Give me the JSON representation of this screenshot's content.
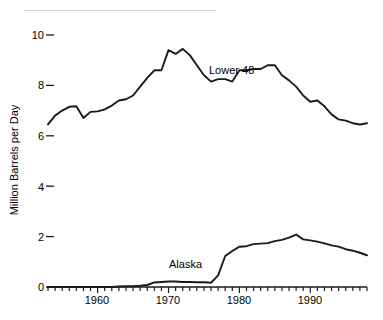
{
  "chart_data": {
    "type": "line",
    "title": "",
    "subtitle": "",
    "xlabel": "",
    "ylabel": "Million Barrels per Day",
    "xlim": [
      1953,
      1998
    ],
    "ylim": [
      0,
      10.6
    ],
    "grid": false,
    "legend_position": "inline-annotation",
    "y_ticks": [
      0,
      2,
      4,
      6,
      8,
      10
    ],
    "y_tick_labels": [
      "0",
      "2",
      "4",
      "6",
      "8",
      "10"
    ],
    "x_ticks": [
      1960,
      1970,
      1980,
      1990
    ],
    "x_tick_labels": [
      "1960",
      "1970",
      "1980",
      "1990"
    ],
    "x_minor_tick_interval": 1,
    "annotations": [
      {
        "text": "Lower 48",
        "x": 1975.5,
        "y": 8.25
      },
      {
        "text": "Alaska",
        "x": 1970.5,
        "y": 1.0
      }
    ],
    "series": [
      {
        "name": "Lower 48",
        "color": "#1a1a1a",
        "x": [
          1953,
          1954,
          1955,
          1956,
          1957,
          1958,
          1959,
          1960,
          1961,
          1962,
          1963,
          1964,
          1965,
          1966,
          1967,
          1968,
          1969,
          1970,
          1971,
          1972,
          1973,
          1974,
          1975,
          1976,
          1977,
          1978,
          1979,
          1980,
          1981,
          1982,
          1983,
          1984,
          1985,
          1986,
          1987,
          1988,
          1989,
          1990,
          1991,
          1992,
          1993,
          1994,
          1995,
          1996,
          1997,
          1998
        ],
        "values": [
          6.45,
          6.8,
          7.0,
          7.15,
          7.17,
          6.71,
          6.95,
          6.97,
          7.05,
          7.2,
          7.4,
          7.45,
          7.6,
          7.95,
          8.3,
          8.6,
          8.6,
          9.4,
          9.25,
          9.45,
          9.2,
          8.8,
          8.4,
          8.15,
          8.25,
          8.25,
          8.15,
          8.6,
          8.6,
          8.65,
          8.65,
          8.8,
          8.8,
          8.4,
          8.2,
          7.95,
          7.6,
          7.35,
          7.4,
          7.17,
          6.85,
          6.65,
          6.6,
          6.5,
          6.45,
          6.5
        ]
      },
      {
        "name": "Alaska",
        "color": "#1a1a1a",
        "x": [
          1953,
          1954,
          1955,
          1956,
          1957,
          1958,
          1959,
          1960,
          1961,
          1962,
          1963,
          1964,
          1965,
          1966,
          1967,
          1968,
          1969,
          1970,
          1971,
          1972,
          1973,
          1974,
          1975,
          1976,
          1977,
          1978,
          1979,
          1980,
          1981,
          1982,
          1983,
          1984,
          1985,
          1986,
          1987,
          1988,
          1989,
          1990,
          1991,
          1992,
          1993,
          1994,
          1995,
          1996,
          1997,
          1998
        ],
        "values": [
          0.0,
          0.0,
          0.0,
          0.0,
          0.0,
          0.0,
          0.0,
          0.0,
          0.0,
          0.0,
          0.02,
          0.03,
          0.03,
          0.05,
          0.08,
          0.18,
          0.2,
          0.22,
          0.22,
          0.2,
          0.2,
          0.19,
          0.19,
          0.17,
          0.46,
          1.23,
          1.43,
          1.6,
          1.62,
          1.7,
          1.72,
          1.74,
          1.82,
          1.87,
          1.96,
          2.08,
          1.89,
          1.85,
          1.8,
          1.73,
          1.65,
          1.6,
          1.5,
          1.44,
          1.36,
          1.26
        ]
      }
    ]
  },
  "axis": {
    "y_title": "Million Barrels per Day"
  }
}
